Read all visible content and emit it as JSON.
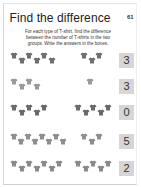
{
  "page": {
    "title": "Find the difference",
    "page_number": "61",
    "instructions": "For each type of T-shirt, find the difference between the number of T-shirts in the two groups. Write the answers in the boxes."
  },
  "rows": [
    {
      "left_count": 6,
      "right_count": 3,
      "answer": "3",
      "shirt_color": "#6f6f6f"
    },
    {
      "left_count": 4,
      "right_count": 1,
      "answer": "3",
      "shirt_color": "#9a9a9a"
    },
    {
      "left_count": 5,
      "right_count": 5,
      "answer": "0",
      "shirt_color": "#6a6a6a"
    },
    {
      "left_count": 8,
      "right_count": 3,
      "answer": "5",
      "shirt_color": "#8e8e8e"
    },
    {
      "left_count": 7,
      "right_count": 5,
      "answer": "2",
      "shirt_color": "#8a8a8a"
    }
  ],
  "icons": {
    "shirt": "t-shirt-icon"
  }
}
